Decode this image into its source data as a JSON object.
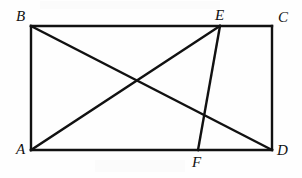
{
  "figure": {
    "type": "geometry-diagram",
    "background_color": "#fefefe",
    "stroke_color": "#111111",
    "stroke_width": 2.4,
    "canvas": {
      "width": 302,
      "height": 178
    },
    "points": [
      {
        "id": "A",
        "label": "A",
        "x": 31,
        "y": 150,
        "label_x": 16,
        "label_y": 142
      },
      {
        "id": "B",
        "label": "B",
        "x": 31,
        "y": 26,
        "label_x": 16,
        "label_y": 9
      },
      {
        "id": "C",
        "label": "C",
        "x": 272,
        "y": 26,
        "label_x": 278,
        "label_y": 10
      },
      {
        "id": "D",
        "label": "D",
        "x": 272,
        "y": 150,
        "label_x": 277,
        "label_y": 143
      },
      {
        "id": "E",
        "label": "E",
        "x": 220,
        "y": 26,
        "label_x": 215,
        "label_y": 8
      },
      {
        "id": "F",
        "label": "F",
        "x": 198,
        "y": 150,
        "label_x": 192,
        "label_y": 155
      }
    ],
    "segments": [
      {
        "name": "side-AB",
        "from": "A",
        "to": "B"
      },
      {
        "name": "side-BC",
        "from": "B",
        "to": "C"
      },
      {
        "name": "side-CD",
        "from": "C",
        "to": "D"
      },
      {
        "name": "side-DA",
        "from": "D",
        "to": "A"
      },
      {
        "name": "diagonal-BD",
        "from": "B",
        "to": "D"
      },
      {
        "name": "segment-AE",
        "from": "A",
        "to": "E"
      },
      {
        "name": "segment-EF",
        "from": "E",
        "to": "F"
      }
    ]
  }
}
